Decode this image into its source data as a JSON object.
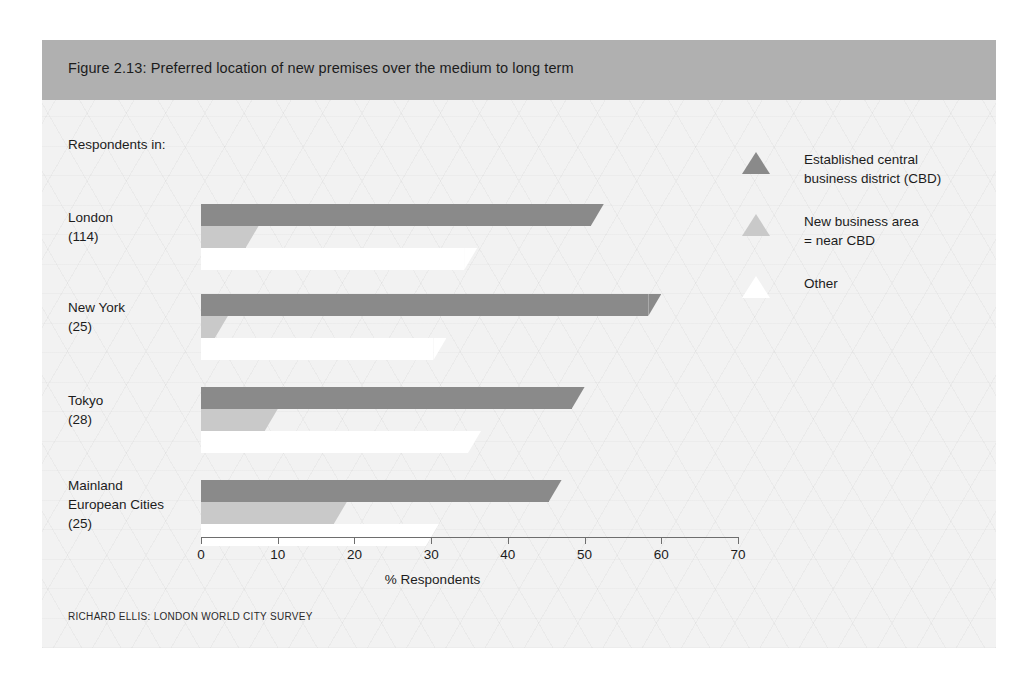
{
  "figure": {
    "title": "Figure 2.13: Preferred location of new premises over the medium to long term",
    "respondents_caption": "Respondents in:",
    "source": "RICHARD ELLIS: LONDON WORLD CITY SURVEY",
    "title_band_color": "#b0b0b0",
    "panel_background_color": "#f2f2f2"
  },
  "legend": {
    "position": "right",
    "items": [
      {
        "marker": "triangle-icon",
        "label": "Established central\nbusiness district (CBD)",
        "color": "#8a8a8a"
      },
      {
        "marker": "triangle-icon",
        "label": "New business area\n=  near CBD",
        "color": "#c9c9c9"
      },
      {
        "marker": "triangle-icon",
        "label": "Other",
        "color": "#ffffff"
      }
    ]
  },
  "chart_data": {
    "type": "bar",
    "orientation": "horizontal",
    "title": "Figure 2.13: Preferred location of new premises over the medium to long term",
    "xlabel": "% Respondents",
    "ylabel": "",
    "xlim": [
      0,
      70
    ],
    "xticks": [
      0,
      10,
      20,
      30,
      40,
      50,
      60,
      70
    ],
    "grid": false,
    "legend_position": "right",
    "categories": [
      "London\n(114)",
      "New York\n(25)",
      "Tokyo\n(28)",
      "Mainland\nEuropean Cities\n(25)"
    ],
    "category_names": [
      "London",
      "New York",
      "Tokyo",
      "Mainland European Cities"
    ],
    "category_counts": [
      "(114)",
      "(25)",
      "(28)",
      "(25)"
    ],
    "series": [
      {
        "name": "Established central business district (CBD)",
        "color": "#8a8a8a",
        "values": [
          52.5,
          60,
          50,
          47
        ]
      },
      {
        "name": "New business area = near CBD",
        "color": "#c9c9c9",
        "values": [
          7.5,
          3.5,
          10,
          19
        ]
      },
      {
        "name": "Other",
        "color": "#ffffff",
        "values": [
          36,
          32,
          36.5,
          31
        ]
      }
    ]
  }
}
